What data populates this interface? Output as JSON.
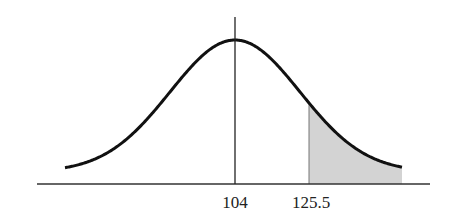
{
  "diagram": {
    "type": "normal-distribution-curve",
    "mean_label": "104",
    "cutoff_label": "125.5",
    "shaded_region": "right tail (x > 125.5)",
    "colors": {
      "curve": "#111111",
      "axis": "#333333",
      "shade": "#d3d3d3",
      "background": "#ffffff"
    }
  },
  "chart_data": {
    "type": "area",
    "title": "",
    "xlabel": "",
    "ylabel": "",
    "distribution": "normal",
    "mean": 104,
    "tick_labels": [
      "104",
      "125.5"
    ],
    "tick_values": [
      104,
      125.5
    ],
    "shaded": {
      "from": 125.5,
      "to": "right tail"
    },
    "grid": false,
    "legend": null
  }
}
